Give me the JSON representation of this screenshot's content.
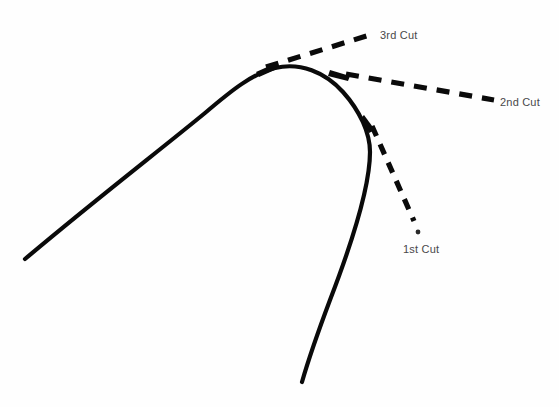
{
  "diagram": {
    "background_color": "#fefefe",
    "ink_color": "#0a0a0a",
    "label_color": "#49484a",
    "canvas": {
      "width": 559,
      "height": 407
    },
    "curve": {
      "name": "main-curve",
      "description": "solid hooked arch curve",
      "stroke_width": 4.2,
      "left_end": [
        25,
        259
      ],
      "apex": [
        292,
        67
      ],
      "inflection": [
        370,
        150
      ],
      "bottom_end": [
        302,
        382
      ]
    },
    "cuts": [
      {
        "id": "cut-1",
        "label": "1st Cut",
        "label_x": 403,
        "label_y": 243,
        "tangent_point": [
          370,
          122
        ],
        "line_end": [
          415,
          222
        ],
        "dot": [
          418,
          232
        ],
        "dash_pattern": "11 9",
        "stroke_width": 5.2
      },
      {
        "id": "cut-2",
        "label": "2nd Cut",
        "label_x": 500,
        "label_y": 96,
        "tangent_point": [
          344,
          73
        ],
        "line_end": [
          494,
          100
        ],
        "dash_pattern": "13 10",
        "stroke_width": 5.2
      },
      {
        "id": "cut-3",
        "label": "3rd Cut",
        "label_x": 380,
        "label_y": 29,
        "tangent_point": [
          262,
          69
        ],
        "line_end": [
          373,
          34
        ],
        "dash_pattern": "13 10",
        "stroke_width": 5.2
      }
    ]
  }
}
